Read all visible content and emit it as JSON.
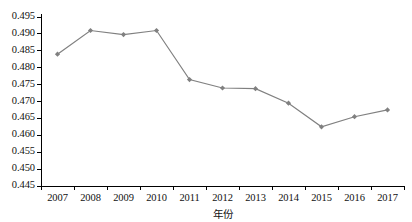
{
  "chart_data": {
    "type": "line",
    "title": "",
    "xlabel": "年份",
    "ylabel": "",
    "categories": [
      "2007",
      "2008",
      "2009",
      "2010",
      "2011",
      "2012",
      "2013",
      "2014",
      "2015",
      "2016",
      "2017"
    ],
    "values": [
      0.484,
      0.491,
      0.4898,
      0.491,
      0.4765,
      0.474,
      0.4738,
      0.4695,
      0.4625,
      0.4655,
      0.4675
    ],
    "series": [
      {
        "name": "",
        "values": [
          0.484,
          0.491,
          0.4898,
          0.491,
          0.4765,
          0.474,
          0.4738,
          0.4695,
          0.4625,
          0.4655,
          0.4675
        ]
      }
    ],
    "ylim": [
      0.445,
      0.495
    ],
    "ytick_labels": [
      "0.495",
      "0.490",
      "0.485",
      "0.480",
      "0.475",
      "0.470",
      "0.465",
      "0.460",
      "0.455",
      "0.450",
      "0.445"
    ],
    "ytick_values": [
      0.495,
      0.49,
      0.485,
      0.48,
      0.475,
      0.47,
      0.465,
      0.46,
      0.455,
      0.45,
      0.445
    ],
    "grid": false,
    "legend": false,
    "legend_position": "none",
    "line_color": "#808080",
    "marker_color": "#808080",
    "marker_shape": "diamond",
    "axis_color": "#000000"
  },
  "colors": {
    "line": "#808080",
    "marker": "#808080",
    "axis": "#000000",
    "text": "#111111",
    "background": "#ffffff"
  }
}
